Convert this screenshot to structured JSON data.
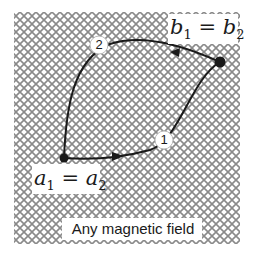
{
  "diagram": {
    "region": {
      "label": "Any magnetic field",
      "hatch_color": "#8a8a8a",
      "background": "#ffffff"
    },
    "points": {
      "start": {
        "label_base_1": "a",
        "sub_1": "1",
        "equals": "=",
        "label_base_2": "a",
        "sub_2": "2"
      },
      "end": {
        "label_base_1": "b",
        "sub_1": "1",
        "equals": "=",
        "label_base_2": "b",
        "sub_2": "2"
      }
    },
    "paths": [
      {
        "id": "path-1",
        "marker": "1"
      },
      {
        "id": "path-2",
        "marker": "2"
      }
    ],
    "colors": {
      "line": "#1a1a1a",
      "marker_fill": "#ffffff",
      "marker_stroke": "#bbbbbb",
      "text": "#1a1a1a"
    }
  }
}
